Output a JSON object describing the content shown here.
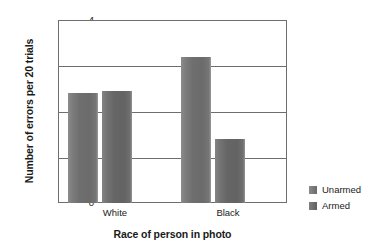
{
  "chart_data": {
    "type": "bar",
    "title": "",
    "xlabel": "Race of person in photo",
    "ylabel": "Number of errors per 20 trials",
    "categories": [
      "White",
      "Black"
    ],
    "series": [
      {
        "name": "Unarmed",
        "values": [
          2.4,
          3.2
        ],
        "color": "#6f6f6f"
      },
      {
        "name": "Armed",
        "values": [
          2.45,
          1.4
        ],
        "color": "#666666"
      }
    ],
    "ylim": [
      0,
      4
    ],
    "yticks": [
      0,
      1,
      2,
      3,
      4
    ],
    "ytick_labels": [
      "0",
      "1",
      "2",
      "3",
      "4"
    ],
    "grid": true,
    "legend_position": "right"
  },
  "axes": {
    "y_title": "Number of errors per 20 trials",
    "x_title": "Race of person in photo",
    "y_labels": {
      "t4": "4",
      "t3": "3",
      "t2": "2",
      "t1": "1",
      "t0": "0"
    },
    "x_labels": {
      "g0": "White",
      "g1": "Black"
    }
  },
  "legend": {
    "items": [
      {
        "label": "Unarmed"
      },
      {
        "label": "Armed"
      }
    ]
  }
}
